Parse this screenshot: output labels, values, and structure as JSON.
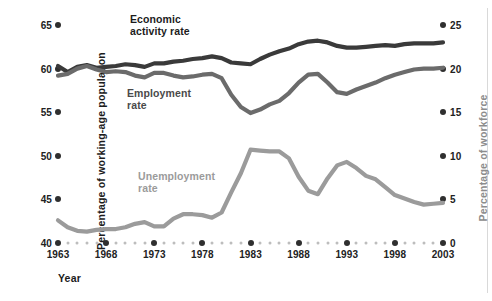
{
  "chart_data": {
    "type": "line",
    "title": "",
    "xlabel": "Year",
    "ylabel": "Percentage of working-age population",
    "y2label": "Percentage of workforce",
    "grid": false,
    "legend_position": "inline-annotations",
    "xlim": [
      1963,
      2003
    ],
    "ylim": [
      40,
      65
    ],
    "y2lim": [
      0,
      25
    ],
    "xticks": [
      "1963",
      "1968",
      "1973",
      "1978",
      "1983",
      "1988",
      "1993",
      "1998",
      "2003"
    ],
    "yticks": [
      "40",
      "45",
      "50",
      "55",
      "60",
      "65"
    ],
    "y2ticks": [
      "0",
      "5",
      "10",
      "15",
      "20",
      "25"
    ],
    "x": [
      1963,
      1964,
      1965,
      1966,
      1967,
      1968,
      1969,
      1970,
      1971,
      1972,
      1973,
      1974,
      1975,
      1976,
      1977,
      1978,
      1979,
      1980,
      1981,
      1982,
      1983,
      1984,
      1985,
      1986,
      1987,
      1988,
      1989,
      1990,
      1991,
      1992,
      1993,
      1994,
      1995,
      1996,
      1997,
      1998,
      1999,
      2000,
      2001,
      2002,
      2003
    ],
    "series": [
      {
        "name": "Economic activity rate",
        "axis": "left",
        "color": "#3a3a3a",
        "values": [
          60.3,
          59.6,
          60.2,
          60.4,
          60.1,
          60.2,
          60.3,
          60.5,
          60.4,
          60.2,
          60.6,
          60.6,
          60.8,
          60.9,
          61.1,
          61.2,
          61.4,
          61.2,
          60.7,
          60.6,
          60.5,
          61.1,
          61.6,
          62.0,
          62.3,
          62.8,
          63.1,
          63.2,
          63.0,
          62.6,
          62.4,
          62.4,
          62.5,
          62.6,
          62.7,
          62.6,
          62.8,
          62.9,
          62.9,
          62.9,
          63.0
        ]
      },
      {
        "name": "Employment rate",
        "axis": "left",
        "color": "#6b6b6b",
        "values": [
          59.2,
          59.4,
          60.0,
          60.3,
          59.9,
          59.6,
          59.7,
          59.6,
          59.2,
          59.0,
          59.5,
          59.5,
          59.2,
          59.0,
          59.1,
          59.3,
          59.4,
          58.9,
          57.0,
          55.6,
          54.9,
          55.3,
          55.9,
          56.3,
          57.2,
          58.4,
          59.3,
          59.4,
          58.4,
          57.3,
          57.1,
          57.6,
          58.0,
          58.4,
          58.9,
          59.3,
          59.6,
          59.9,
          60.0,
          60.0,
          60.1
        ]
      },
      {
        "name": "Unemployment rate",
        "axis": "right",
        "color": "#9b9b9b",
        "values": [
          2.6,
          1.8,
          1.4,
          1.3,
          1.5,
          1.6,
          1.6,
          1.8,
          2.2,
          2.4,
          1.9,
          1.9,
          2.8,
          3.3,
          3.3,
          3.2,
          2.9,
          3.5,
          5.8,
          8.0,
          10.7,
          10.6,
          10.5,
          10.5,
          9.7,
          7.6,
          6.0,
          5.6,
          7.4,
          8.9,
          9.3,
          8.6,
          7.7,
          7.3,
          6.4,
          5.5,
          5.1,
          4.7,
          4.4,
          4.5,
          4.6
        ]
      }
    ]
  },
  "axes": {
    "x_title": "Year",
    "y_left_title": "Percentage of working-age population",
    "y_right_title": "Percentage of workforce"
  },
  "annotations": {
    "economic": "Economic\nactivity rate",
    "employment": "Employment\nrate",
    "unemployment": "Unemployment\nrate"
  }
}
